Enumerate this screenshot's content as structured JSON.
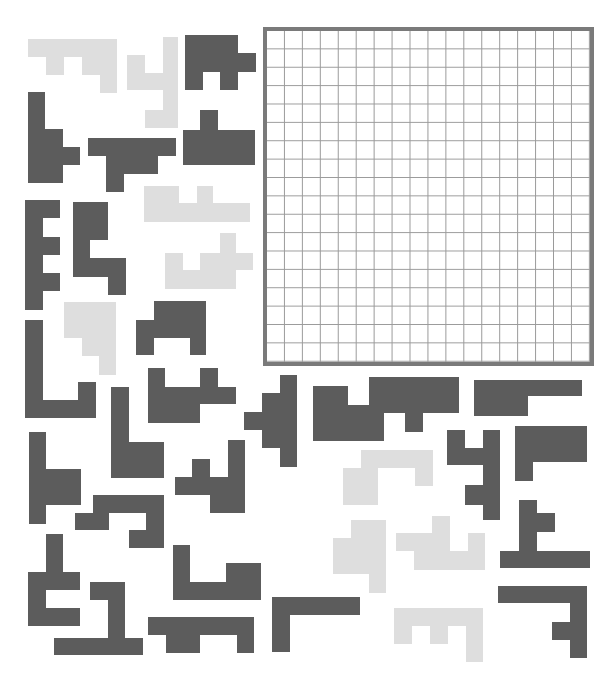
{
  "board": {
    "rows": 18,
    "cols": 18,
    "border_color": "#7a7a7a",
    "grid_color": "#9a9a9a"
  },
  "colors": {
    "dark": "#5c5c5c",
    "light": "#dedede",
    "background": "#ffffff"
  },
  "pieces": [
    {
      "id": "A",
      "tone": "light",
      "rects": [
        [
          28,
          39,
          89,
          18
        ],
        [
          46,
          57,
          18,
          18
        ],
        [
          82,
          57,
          35,
          18
        ],
        [
          100,
          75,
          17,
          18
        ]
      ]
    },
    {
      "id": "B",
      "tone": "light",
      "rects": [
        [
          127,
          55,
          18,
          35
        ],
        [
          145,
          73,
          18,
          17
        ],
        [
          163,
          37,
          15,
          91
        ],
        [
          145,
          110,
          18,
          18
        ]
      ]
    },
    {
      "id": "C",
      "tone": "dark",
      "rects": [
        [
          185,
          35,
          53,
          37
        ],
        [
          238,
          53,
          18,
          19
        ],
        [
          185,
          72,
          18,
          18
        ],
        [
          220,
          72,
          18,
          18
        ]
      ]
    },
    {
      "id": "D",
      "tone": "dark",
      "rects": [
        [
          28,
          92,
          17,
          91
        ],
        [
          45,
          129,
          18,
          54
        ],
        [
          63,
          147,
          17,
          18
        ]
      ]
    },
    {
      "id": "E",
      "tone": "dark",
      "rects": [
        [
          88,
          138,
          88,
          18
        ],
        [
          106,
          156,
          52,
          18
        ],
        [
          106,
          174,
          18,
          18
        ]
      ]
    },
    {
      "id": "F",
      "tone": "dark",
      "rects": [
        [
          200,
          110,
          18,
          20
        ],
        [
          183,
          130,
          72,
          35
        ]
      ]
    },
    {
      "id": "G",
      "tone": "dark",
      "rects": [
        [
          25,
          200,
          18,
          110
        ],
        [
          43,
          200,
          17,
          18
        ],
        [
          43,
          237,
          17,
          18
        ],
        [
          43,
          273,
          17,
          18
        ]
      ]
    },
    {
      "id": "H",
      "tone": "dark",
      "rects": [
        [
          73,
          202,
          35,
          38
        ],
        [
          73,
          240,
          17,
          37
        ],
        [
          90,
          258,
          36,
          19
        ],
        [
          108,
          277,
          18,
          18
        ]
      ]
    },
    {
      "id": "I",
      "tone": "light",
      "rects": [
        [
          144,
          186,
          35,
          17
        ],
        [
          197,
          186,
          16,
          17
        ],
        [
          144,
          203,
          106,
          19
        ]
      ]
    },
    {
      "id": "J",
      "tone": "light",
      "rects": [
        [
          220,
          233,
          16,
          20
        ],
        [
          165,
          253,
          18,
          17
        ],
        [
          200,
          253,
          53,
          17
        ],
        [
          165,
          270,
          71,
          19
        ]
      ]
    },
    {
      "id": "K",
      "tone": "light",
      "rects": [
        [
          64,
          302,
          52,
          36
        ],
        [
          82,
          338,
          34,
          18
        ],
        [
          99,
          356,
          17,
          19
        ]
      ]
    },
    {
      "id": "L",
      "tone": "dark",
      "rects": [
        [
          154,
          301,
          52,
          19
        ],
        [
          136,
          320,
          70,
          18
        ],
        [
          136,
          338,
          18,
          17
        ],
        [
          190,
          338,
          16,
          17
        ]
      ]
    },
    {
      "id": "M",
      "tone": "dark",
      "rects": [
        [
          25,
          320,
          18,
          98
        ],
        [
          43,
          400,
          53,
          18
        ],
        [
          78,
          382,
          18,
          18
        ]
      ]
    },
    {
      "id": "N",
      "tone": "dark",
      "rects": [
        [
          111,
          387,
          18,
          91
        ],
        [
          129,
          442,
          35,
          36
        ]
      ]
    },
    {
      "id": "O",
      "tone": "dark",
      "rects": [
        [
          148,
          368,
          17,
          55
        ],
        [
          165,
          387,
          35,
          36
        ],
        [
          200,
          387,
          36,
          17
        ],
        [
          200,
          368,
          18,
          19
        ]
      ]
    },
    {
      "id": "P",
      "tone": "dark",
      "rects": [
        [
          280,
          375,
          17,
          92
        ],
        [
          262,
          393,
          18,
          55
        ],
        [
          244,
          412,
          18,
          18
        ]
      ]
    },
    {
      "id": "Q",
      "tone": "dark",
      "rects": [
        [
          29,
          432,
          17,
          92
        ],
        [
          46,
          469,
          35,
          36
        ]
      ]
    },
    {
      "id": "R",
      "tone": "dark",
      "rects": [
        [
          93,
          495,
          71,
          18
        ],
        [
          75,
          513,
          34,
          17
        ],
        [
          146,
          513,
          18,
          35
        ],
        [
          129,
          530,
          17,
          18
        ]
      ]
    },
    {
      "id": "S",
      "tone": "dark",
      "rects": [
        [
          192,
          459,
          18,
          18
        ],
        [
          175,
          477,
          70,
          18
        ],
        [
          228,
          440,
          17,
          73
        ],
        [
          210,
          495,
          35,
          18
        ]
      ]
    },
    {
      "id": "T",
      "tone": "dark",
      "rects": [
        [
          46,
          534,
          17,
          38
        ],
        [
          28,
          572,
          52,
          18
        ],
        [
          28,
          590,
          18,
          18
        ],
        [
          28,
          608,
          52,
          18
        ]
      ]
    },
    {
      "id": "U",
      "tone": "dark",
      "rects": [
        [
          90,
          582,
          35,
          18
        ],
        [
          108,
          600,
          17,
          38
        ],
        [
          54,
          638,
          89,
          17
        ]
      ]
    },
    {
      "id": "V",
      "tone": "dark",
      "rects": [
        [
          173,
          545,
          17,
          55
        ],
        [
          173,
          582,
          88,
          18
        ],
        [
          226,
          563,
          35,
          19
        ]
      ]
    },
    {
      "id": "W",
      "tone": "dark",
      "rects": [
        [
          148,
          617,
          106,
          18
        ],
        [
          166,
          635,
          34,
          18
        ],
        [
          237,
          635,
          17,
          18
        ]
      ]
    },
    {
      "id": "X",
      "tone": "dark",
      "rects": [
        [
          272,
          597,
          88,
          18
        ],
        [
          272,
          615,
          18,
          37
        ]
      ]
    },
    {
      "id": "Y",
      "tone": "dark",
      "rects": [
        [
          313,
          386,
          35,
          55
        ],
        [
          348,
          405,
          36,
          36
        ]
      ]
    },
    {
      "id": "Z",
      "tone": "dark",
      "rects": [
        [
          369,
          377,
          90,
          36
        ],
        [
          405,
          413,
          18,
          19
        ]
      ]
    },
    {
      "id": "AA",
      "tone": "dark",
      "rects": [
        [
          474,
          380,
          108,
          16
        ],
        [
          474,
          396,
          54,
          20
        ]
      ]
    },
    {
      "id": "AB",
      "tone": "dark",
      "rects": [
        [
          447,
          430,
          18,
          35
        ],
        [
          465,
          448,
          18,
          17
        ],
        [
          483,
          430,
          17,
          90
        ],
        [
          465,
          485,
          18,
          20
        ]
      ]
    },
    {
      "id": "AC",
      "tone": "dark",
      "rects": [
        [
          515,
          426,
          72,
          36
        ],
        [
          515,
          462,
          18,
          19
        ]
      ]
    },
    {
      "id": "AD",
      "tone": "light",
      "rects": [
        [
          361,
          450,
          72,
          18
        ],
        [
          343,
          468,
          35,
          37
        ],
        [
          415,
          468,
          18,
          18
        ]
      ]
    },
    {
      "id": "AE",
      "tone": "light",
      "rects": [
        [
          351,
          520,
          35,
          18
        ],
        [
          333,
          538,
          53,
          36
        ],
        [
          369,
          574,
          17,
          19
        ]
      ]
    },
    {
      "id": "AF",
      "tone": "light",
      "rects": [
        [
          432,
          516,
          18,
          18
        ],
        [
          396,
          533,
          54,
          18
        ],
        [
          468,
          533,
          17,
          18
        ],
        [
          414,
          551,
          71,
          19
        ]
      ]
    },
    {
      "id": "AG",
      "tone": "dark",
      "rects": [
        [
          519,
          500,
          18,
          52
        ],
        [
          537,
          513,
          18,
          19
        ],
        [
          500,
          551,
          90,
          17
        ]
      ]
    },
    {
      "id": "AH",
      "tone": "dark",
      "rects": [
        [
          498,
          586,
          89,
          17
        ],
        [
          570,
          603,
          17,
          55
        ],
        [
          552,
          622,
          18,
          18
        ]
      ]
    },
    {
      "id": "AI",
      "tone": "light",
      "rects": [
        [
          394,
          608,
          89,
          18
        ],
        [
          394,
          626,
          18,
          18
        ],
        [
          430,
          626,
          18,
          18
        ],
        [
          466,
          626,
          17,
          36
        ]
      ]
    }
  ]
}
